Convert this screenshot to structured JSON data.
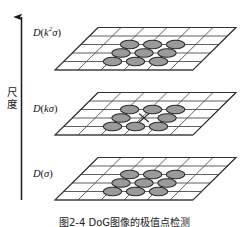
{
  "figure": {
    "kind": "scale-space-diagram",
    "background_color": "#ffffff",
    "caption": "图2-4  DoG图像的极值点检测",
    "axis": {
      "name": "scale-axis",
      "label": "尺度",
      "direction": "up",
      "color": "#1a1a1a"
    },
    "colors": {
      "grid_line": "#4d4d4d",
      "plane_outline": "#333333",
      "ellipse_fill": "#9a9a9a",
      "ellipse_stroke": "#2b2b2b",
      "marker_stroke": "#2b2b2b",
      "text": "#111111"
    },
    "planes": [
      {
        "id": "plane-top",
        "label_plain": "D(k2σ)",
        "label_d": "D",
        "label_open": "(",
        "label_k": "k",
        "label_exp": "2",
        "label_sigma": "σ",
        "label_close": ")",
        "grid_cols": 6,
        "grid_rows": 5,
        "ellipse_count": 9,
        "has_center_marker": false,
        "center_marker": ""
      },
      {
        "id": "plane-middle",
        "label_plain": "D(kσ)",
        "label_d": "D",
        "label_open": "(",
        "label_k": "k",
        "label_exp": "",
        "label_sigma": "σ",
        "label_close": ")",
        "grid_cols": 6,
        "grid_rows": 5,
        "ellipse_count": 8,
        "has_center_marker": true,
        "center_marker": "×"
      },
      {
        "id": "plane-bottom",
        "label_plain": "D(σ)",
        "label_d": "D",
        "label_open": "(",
        "label_k": "",
        "label_exp": "",
        "label_sigma": "σ",
        "label_close": ")",
        "grid_cols": 6,
        "grid_rows": 5,
        "ellipse_count": 9,
        "has_center_marker": false,
        "center_marker": ""
      }
    ]
  }
}
